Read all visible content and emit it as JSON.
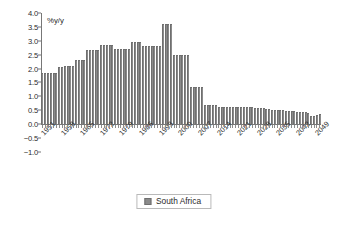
{
  "chart_data": {
    "type": "bar",
    "title": "",
    "subtitle": "",
    "xlabel": "",
    "ylabel": "%y/y",
    "unit_label": "%y/y",
    "ylim": [
      -1.0,
      4.0
    ],
    "yticks": [
      4.0,
      3.5,
      3.0,
      2.5,
      2.0,
      1.5,
      1.0,
      0.5,
      0.0,
      -0.5,
      -1.0
    ],
    "ytick_labels": [
      "4.0",
      "3.5",
      "3.0",
      "2.5",
      "2.0",
      "1.5",
      "1.0",
      "0.5",
      "0.0",
      "-0.5",
      "-1.0"
    ],
    "grid": false,
    "legend_position": "bottom-center",
    "legend": [
      "South Africa"
    ],
    "xtick_labels": [
      "1951",
      "1958",
      "1965",
      "1972",
      "1979",
      "1986",
      "1993",
      "2000",
      "2007",
      "2014",
      "2021",
      "2028",
      "2035",
      "2042",
      "2049"
    ],
    "xtick_step_years": 7,
    "x_start": 1951,
    "x_end": 2050,
    "categories": [
      "1951",
      "1952",
      "1953",
      "1954",
      "1955",
      "1956",
      "1957",
      "1958",
      "1959",
      "1960",
      "1961",
      "1962",
      "1963",
      "1964",
      "1965",
      "1966",
      "1967",
      "1968",
      "1969",
      "1970",
      "1971",
      "1972",
      "1973",
      "1974",
      "1975",
      "1976",
      "1977",
      "1978",
      "1979",
      "1980",
      "1981",
      "1982",
      "1983",
      "1984",
      "1985",
      "1986",
      "1987",
      "1988",
      "1989",
      "1990",
      "1991",
      "1992",
      "1993",
      "1994",
      "1995",
      "1996",
      "1997",
      "1998",
      "1999",
      "2000",
      "2001",
      "2002",
      "2003",
      "2004",
      "2005",
      "2006",
      "2007",
      "2008",
      "2009",
      "2010",
      "2011",
      "2012",
      "2013",
      "2014",
      "2015",
      "2016",
      "2017",
      "2018",
      "2019",
      "2020",
      "2021",
      "2022",
      "2023",
      "2024",
      "2025",
      "2026",
      "2027",
      "2028",
      "2029",
      "2030",
      "2031",
      "2032",
      "2033",
      "2034",
      "2035",
      "2036",
      "2037",
      "2038",
      "2039",
      "2040",
      "2041",
      "2042",
      "2043",
      "2044",
      "2045",
      "2046",
      "2047",
      "2048",
      "2049",
      "2050"
    ],
    "series": [
      {
        "name": "South Africa",
        "color": "#8a8a8a",
        "values": [
          1.85,
          1.85,
          1.85,
          1.85,
          1.85,
          1.85,
          2.05,
          2.05,
          2.08,
          2.08,
          2.08,
          2.08,
          2.3,
          2.3,
          2.3,
          2.3,
          2.65,
          2.65,
          2.65,
          2.65,
          2.65,
          2.85,
          2.85,
          2.85,
          2.85,
          2.85,
          2.7,
          2.7,
          2.7,
          2.7,
          2.7,
          2.7,
          2.95,
          2.95,
          2.95,
          2.95,
          2.8,
          2.8,
          2.8,
          2.8,
          2.8,
          2.8,
          2.8,
          3.6,
          3.6,
          3.6,
          3.6,
          2.5,
          2.5,
          2.5,
          2.5,
          2.5,
          2.5,
          1.35,
          1.35,
          1.35,
          1.35,
          1.35,
          0.7,
          0.7,
          0.7,
          0.7,
          0.7,
          0.6,
          0.6,
          0.6,
          0.6,
          0.6,
          0.62,
          0.62,
          0.62,
          0.62,
          0.62,
          0.6,
          0.6,
          0.6,
          0.58,
          0.58,
          0.56,
          0.56,
          0.54,
          0.54,
          0.52,
          0.52,
          0.5,
          0.5,
          0.5,
          0.48,
          0.48,
          0.46,
          0.46,
          0.45,
          0.44,
          0.43,
          0.42,
          0.4,
          0.3,
          0.3,
          0.33,
          0.35
        ]
      }
    ]
  },
  "legend": {
    "label": "South Africa"
  }
}
